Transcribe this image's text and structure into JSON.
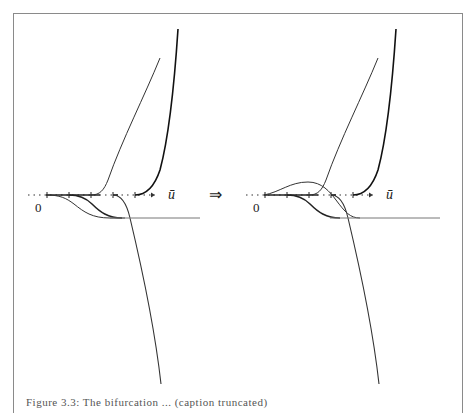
{
  "figure": {
    "left_panel": {
      "origin_label": "0",
      "axis_label": "ū"
    },
    "right_panel": {
      "origin_label": "0",
      "axis_label": "ū"
    },
    "implies_symbol": "⇒",
    "caption": "Figure 3.3: The bifurcation ... (caption truncated)"
  }
}
